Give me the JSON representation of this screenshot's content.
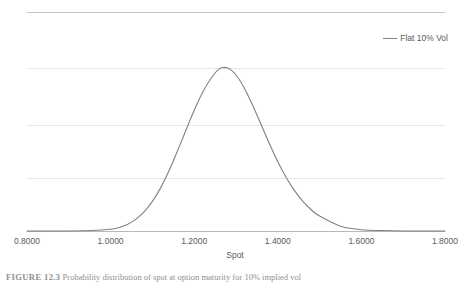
{
  "chart_data": {
    "type": "line",
    "title": "",
    "xlabel": "Spot",
    "ylabel": "Probability Distribution Function",
    "xlim": [
      0.8,
      1.8
    ],
    "ylim": [
      0,
      1.0
    ],
    "xticks": [
      "0.8000",
      "1.0000",
      "1.2000",
      "1.4000",
      "1.6000",
      "1.8000"
    ],
    "xtick_values": [
      0.8,
      1.0,
      1.2,
      1.4,
      1.6,
      1.8
    ],
    "yticks": [],
    "grid": "horizontal",
    "gridline_count": 5,
    "legend_position": "top-right",
    "series": [
      {
        "name": "Flat 10% Vol",
        "color": "#808080",
        "peak_x": 1.26,
        "peak_y": 0.745,
        "x": [
          0.8,
          0.85,
          0.9,
          0.95,
          1.0,
          1.02,
          1.04,
          1.06,
          1.08,
          1.1,
          1.12,
          1.14,
          1.16,
          1.18,
          1.2,
          1.22,
          1.24,
          1.26,
          1.28,
          1.3,
          1.32,
          1.34,
          1.36,
          1.38,
          1.4,
          1.42,
          1.44,
          1.46,
          1.48,
          1.5,
          1.55,
          1.6,
          1.65,
          1.7,
          1.75,
          1.8
        ],
        "y": [
          0.0,
          0.0,
          0.0,
          0.002,
          0.008,
          0.016,
          0.03,
          0.053,
          0.087,
          0.135,
          0.198,
          0.276,
          0.365,
          0.459,
          0.551,
          0.632,
          0.696,
          0.74,
          0.744,
          0.712,
          0.652,
          0.573,
          0.486,
          0.398,
          0.316,
          0.244,
          0.184,
          0.135,
          0.097,
          0.068,
          0.022,
          0.006,
          0.002,
          0.0,
          0.0,
          0.0
        ]
      }
    ]
  },
  "legend": {
    "entries": [
      {
        "label": "Flat 10% Vol",
        "color": "#808080"
      }
    ]
  },
  "axes": {
    "x_title": "Spot",
    "y_title": "Probability Distribution Function"
  },
  "caption": {
    "label": "FIGURE 12.3",
    "text": "Probability distribution of spot at option maturity for 10% implied vol"
  }
}
